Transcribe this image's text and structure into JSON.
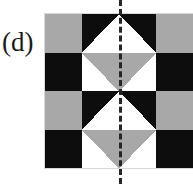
{
  "figure": {
    "panel_label": "(d)",
    "symmetry_axis": {
      "name": "vertical-mirror-line",
      "orientation": "vertical",
      "style": "dashed",
      "color": "#262626",
      "x_position_px": 120
    }
  },
  "palette": {
    "black": "#0d0d0d",
    "gray": "#a8a8a8",
    "white": "#ffffff",
    "grid_border": "#d8d8d8",
    "label_color": "#1a1a1a"
  },
  "grid": {
    "rows": 4,
    "columns": 4,
    "left_px": 45,
    "top_px": 14,
    "width_px": 148,
    "height_px": 154,
    "cells": [
      {
        "row": 1,
        "col": 1,
        "name": "cell-r1c1",
        "motif": "solid",
        "base": "gray",
        "shape": "none"
      },
      {
        "row": 1,
        "col": 2,
        "name": "cell-r1c2",
        "motif": "half-triangle",
        "base": "black",
        "shape": "triangle-up-right-half",
        "shape_fill": "white"
      },
      {
        "row": 1,
        "col": 3,
        "name": "cell-r1c3",
        "motif": "half-triangle",
        "base": "black",
        "shape": "triangle-up-left-half",
        "shape_fill": "white"
      },
      {
        "row": 1,
        "col": 4,
        "name": "cell-r1c4",
        "motif": "solid",
        "base": "gray",
        "shape": "none"
      },
      {
        "row": 2,
        "col": 1,
        "name": "cell-r2c1",
        "motif": "solid",
        "base": "black",
        "shape": "none"
      },
      {
        "row": 2,
        "col": 2,
        "name": "cell-r2c2",
        "motif": "half-triangle",
        "base": "white",
        "shape": "triangle-down-right-half",
        "shape_fill": "gray"
      },
      {
        "row": 2,
        "col": 3,
        "name": "cell-r2c3",
        "motif": "half-triangle",
        "base": "white",
        "shape": "triangle-down-left-half",
        "shape_fill": "gray"
      },
      {
        "row": 2,
        "col": 4,
        "name": "cell-r2c4",
        "motif": "solid",
        "base": "black",
        "shape": "none"
      },
      {
        "row": 3,
        "col": 1,
        "name": "cell-r3c1",
        "motif": "solid",
        "base": "gray",
        "shape": "none"
      },
      {
        "row": 3,
        "col": 2,
        "name": "cell-r3c2",
        "motif": "half-triangle",
        "base": "black",
        "shape": "triangle-up-right-half",
        "shape_fill": "white"
      },
      {
        "row": 3,
        "col": 3,
        "name": "cell-r3c3",
        "motif": "half-triangle",
        "base": "black",
        "shape": "triangle-up-left-half",
        "shape_fill": "white"
      },
      {
        "row": 3,
        "col": 4,
        "name": "cell-r3c4",
        "motif": "solid",
        "base": "gray",
        "shape": "none"
      },
      {
        "row": 4,
        "col": 1,
        "name": "cell-r4c1",
        "motif": "solid",
        "base": "black",
        "shape": "none"
      },
      {
        "row": 4,
        "col": 2,
        "name": "cell-r4c2",
        "motif": "half-triangle",
        "base": "white",
        "shape": "triangle-down-right-half",
        "shape_fill": "gray"
      },
      {
        "row": 4,
        "col": 3,
        "name": "cell-r4c3",
        "motif": "half-triangle",
        "base": "white",
        "shape": "triangle-down-left-half",
        "shape_fill": "gray"
      },
      {
        "row": 4,
        "col": 4,
        "name": "cell-r4c4",
        "motif": "solid",
        "base": "black",
        "shape": "none"
      }
    ]
  }
}
